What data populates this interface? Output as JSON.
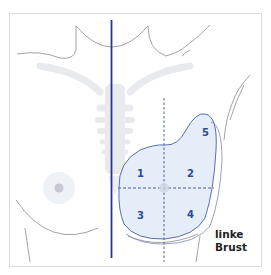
{
  "diagram": {
    "type": "anatomical-illustration",
    "side_label": {
      "line1": "linke",
      "line2": "Brust"
    },
    "quadrants": [
      {
        "id": "1",
        "label": "1"
      },
      {
        "id": "2",
        "label": "2"
      },
      {
        "id": "3",
        "label": "3"
      },
      {
        "id": "4",
        "label": "4"
      },
      {
        "id": "5",
        "label": "5"
      }
    ],
    "colors": {
      "midline": "#22389a",
      "outline": "#4a5fa8",
      "fill": "#e3ecf7",
      "body_outline": "#8a8a8a",
      "skeleton": "#e6e9ee",
      "frame": "#d8d8d8"
    }
  }
}
